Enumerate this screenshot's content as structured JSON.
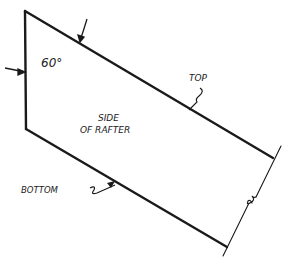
{
  "diagram": {
    "labels": {
      "angle": "60°",
      "top": "TOP",
      "side_line1": "SIDE",
      "side_line2": "OF RAFTER",
      "bottom": "BOTTOM"
    },
    "colors": {
      "stroke": "#1a1a1a",
      "background": "#ffffff"
    }
  }
}
